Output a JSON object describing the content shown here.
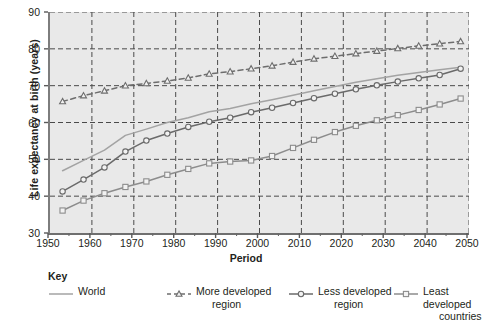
{
  "chart_data": {
    "type": "line",
    "title": "",
    "xlabel": "Period",
    "ylabel": "Life expectancy at birth (years)",
    "xlim": [
      1950,
      2050
    ],
    "ylim": [
      30,
      90
    ],
    "xticks": [
      1950,
      1960,
      1970,
      1980,
      1990,
      2000,
      2010,
      2020,
      2030,
      2040,
      2050
    ],
    "xminorticks": [
      1955,
      1965,
      1975,
      1985,
      1995,
      2005,
      2015,
      2025,
      2035,
      2045
    ],
    "yticks": [
      30,
      40,
      50,
      60,
      70,
      80,
      90
    ],
    "grid": "dashed gridlines on both axes",
    "legend_position": "below-plot",
    "plot_background": "#e9e9e9",
    "x": [
      1953,
      1958,
      1963,
      1968,
      1973,
      1978,
      1983,
      1988,
      1993,
      1998,
      2003,
      2008,
      2013,
      2018,
      2023,
      2028,
      2033,
      2038,
      2043,
      2048
    ],
    "series": [
      {
        "name": "World",
        "color": "#a3a3a3",
        "line": "solid",
        "marker": "none",
        "values": [
          46.9,
          49.7,
          52.5,
          56.5,
          58.2,
          60.0,
          61.3,
          62.9,
          63.8,
          65.1,
          66.2,
          67.4,
          68.6,
          69.8,
          70.9,
          71.9,
          72.8,
          73.6,
          74.3,
          75.0
        ]
      },
      {
        "name": "More developed region",
        "color": "#6d6d6d",
        "line": "dashed",
        "marker": "triangle-open",
        "values": [
          65.7,
          67.3,
          68.6,
          70.0,
          70.6,
          71.3,
          72.1,
          73.2,
          73.8,
          74.6,
          75.4,
          76.4,
          77.3,
          78.0,
          78.7,
          79.4,
          80.1,
          80.8,
          81.4,
          82.0
        ]
      },
      {
        "name": "Less developed region",
        "color": "#6a6a6a",
        "line": "solid",
        "marker": "circle-open",
        "values": [
          41.3,
          44.5,
          47.8,
          52.1,
          55.1,
          57.0,
          58.8,
          60.2,
          61.3,
          62.8,
          64.0,
          65.3,
          66.6,
          67.8,
          69.0,
          70.1,
          71.1,
          72.0,
          72.9,
          74.6
        ]
      },
      {
        "name": "Least developed countries",
        "color": "#8c8c8c",
        "line": "solid",
        "marker": "square-open",
        "values": [
          36.1,
          38.8,
          40.8,
          42.5,
          44.0,
          45.8,
          47.4,
          48.9,
          49.4,
          49.7,
          50.9,
          53.1,
          55.3,
          57.4,
          59.1,
          60.6,
          62.0,
          63.4,
          64.9,
          66.5
        ]
      }
    ]
  },
  "axis": {
    "ylabel": "Life expectancy at birth (years)",
    "xlabel": "Period",
    "yticks": [
      "30",
      "40",
      "50",
      "60",
      "70",
      "80",
      "90"
    ],
    "xticks": [
      "1950",
      "1960",
      "1970",
      "1980",
      "1990",
      "2000",
      "2010",
      "2020",
      "2030",
      "2040",
      "2050"
    ]
  },
  "key": {
    "title": "Key",
    "items": [
      {
        "label": "World",
        "marker": "line-plain",
        "color": "#a3a3a3"
      },
      {
        "label": "More developed\nregion",
        "marker": "dashed-triangle",
        "color": "#6d6d6d"
      },
      {
        "label": "Less developed\nregion",
        "marker": "line-circle",
        "color": "#6a6a6a"
      },
      {
        "label": "Least developed\ncountries",
        "marker": "line-square",
        "color": "#8c8c8c"
      }
    ]
  }
}
